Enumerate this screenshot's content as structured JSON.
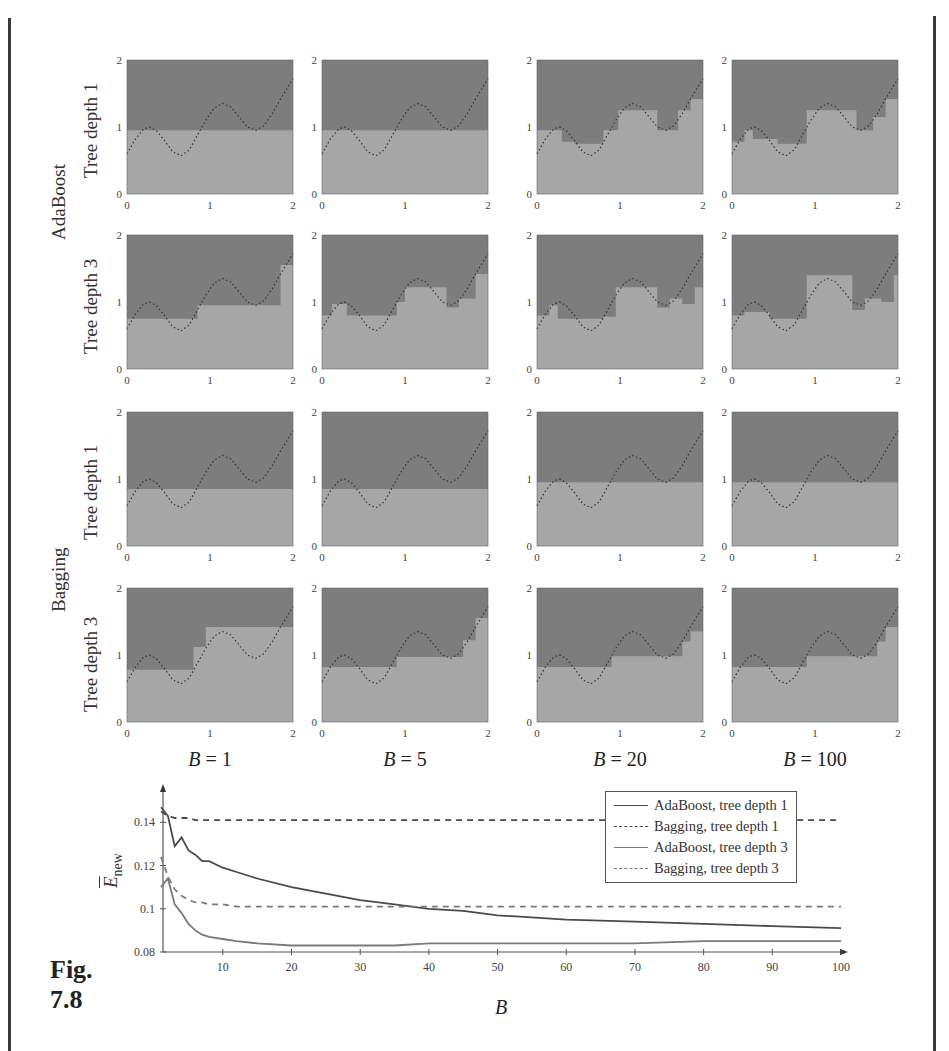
{
  "figure": {
    "label_line1": "Fig.",
    "label_line2": "7.8"
  },
  "grid": {
    "group_labels": [
      "AdaBoost",
      "Bagging"
    ],
    "row_labels": [
      "Tree depth 1",
      "Tree depth 3",
      "Tree depth 1",
      "Tree depth 3"
    ],
    "column_labels": [
      {
        "var": "B",
        "eq": " = ",
        "num": "1"
      },
      {
        "var": "B",
        "eq": " = ",
        "num": "5"
      },
      {
        "var": "B",
        "eq": " = ",
        "num": "20"
      },
      {
        "var": "B",
        "eq": " = ",
        "num": "100"
      }
    ],
    "axis_ticks": {
      "x": [
        "0",
        "1",
        "2"
      ],
      "y": [
        "0",
        "1",
        "2"
      ]
    },
    "colors": {
      "class_upper": "#7d7d7d",
      "class_lower": "#a6a6a6",
      "true_boundary": "#333333"
    }
  },
  "legend": {
    "items": [
      {
        "label": "AdaBoost, tree depth 1",
        "style": "solid-dark"
      },
      {
        "label": "Bagging, tree depth 1",
        "style": "dash-dark"
      },
      {
        "label": "AdaBoost, tree depth 3",
        "style": "solid-light"
      },
      {
        "label": "Bagging, tree depth 3",
        "style": "dash-light"
      }
    ]
  },
  "chart_data": [
    {
      "type": "heatmap",
      "title": "Decision boundaries: AdaBoost vs Bagging for B = 1, 5, 20, 100",
      "rows": [
        "AdaBoost, Tree depth 1",
        "AdaBoost, Tree depth 3",
        "Bagging, Tree depth 1",
        "Bagging, Tree depth 3"
      ],
      "columns": [
        "B = 1",
        "B = 5",
        "B = 20",
        "B = 100"
      ],
      "xlim": [
        0,
        2
      ],
      "ylim": [
        0,
        2
      ],
      "x_ticks": [
        0,
        1,
        2
      ],
      "y_ticks": [
        0,
        1,
        2
      ],
      "true_boundary": "dotted sinusoid-like curve from (0,0.6) peaking ~1.0 at x≈0.27, dipping ~0.57 at x≈0.65, peaking ~1.35 at x≈1.15, dipping ~0.95 at x≈1.55, rising to ~1.7 at x=2",
      "boundaries": {
        "AdaBoost, Tree depth 1": {
          "B = 1": "flat at y≈0.95",
          "B = 5": "flat at y≈0.95",
          "B = 20": "staircase approx. following curve",
          "B = 100": "staircase approx. following curve"
        },
        "AdaBoost, Tree depth 3": {
          "B = 1": "coarse steps",
          "B = 5": "steps",
          "B = 20": "finer steps",
          "B = 100": "finer steps"
        },
        "Bagging, Tree depth 1": {
          "B = 1": "flat at y≈0.85",
          "B = 5": "flat at y≈0.85",
          "B = 20": "flat at y≈0.95",
          "B = 100": "flat at y≈0.95"
        },
        "Bagging, Tree depth 3": {
          "B = 1": "coarse steps",
          "B = 5": "steps",
          "B = 20": "steps",
          "B = 100": "steps"
        }
      }
    },
    {
      "type": "line",
      "title": "",
      "xlabel": "B",
      "ylabel": "Ē_new",
      "xlim": [
        1,
        100
      ],
      "ylim": [
        0.08,
        0.15
      ],
      "x_ticks": [
        10,
        20,
        30,
        40,
        50,
        60,
        70,
        80,
        90,
        100
      ],
      "y_ticks": [
        0.08,
        0.1,
        0.12,
        0.14
      ],
      "legend_position": "upper right",
      "grid": false,
      "x": [
        1,
        2,
        3,
        4,
        5,
        6,
        7,
        8,
        10,
        12,
        15,
        20,
        25,
        30,
        35,
        40,
        45,
        50,
        60,
        70,
        80,
        90,
        100
      ],
      "series": [
        {
          "name": "AdaBoost, tree depth 1",
          "style": "solid",
          "color": "#4a4a4a",
          "values": [
            0.147,
            0.143,
            0.129,
            0.133,
            0.127,
            0.125,
            0.122,
            0.122,
            0.119,
            0.117,
            0.114,
            0.11,
            0.107,
            0.104,
            0.102,
            0.1,
            0.099,
            0.097,
            0.095,
            0.094,
            0.093,
            0.092,
            0.091
          ]
        },
        {
          "name": "Bagging, tree depth 1",
          "style": "dashed",
          "color": "#4a4a4a",
          "values": [
            0.145,
            0.143,
            0.142,
            0.142,
            0.142,
            0.141,
            0.141,
            0.141,
            0.141,
            0.141,
            0.141,
            0.141,
            0.141,
            0.141,
            0.141,
            0.141,
            0.141,
            0.141,
            0.141,
            0.141,
            0.141,
            0.141,
            0.141
          ]
        },
        {
          "name": "AdaBoost, tree depth 3",
          "style": "solid",
          "color": "#7a7a7a",
          "values": [
            0.11,
            0.114,
            0.102,
            0.098,
            0.093,
            0.09,
            0.088,
            0.087,
            0.086,
            0.085,
            0.084,
            0.083,
            0.083,
            0.083,
            0.083,
            0.084,
            0.084,
            0.084,
            0.084,
            0.084,
            0.085,
            0.085,
            0.085
          ]
        },
        {
          "name": "Bagging, tree depth 3",
          "style": "dashed",
          "color": "#7a7a7a",
          "values": [
            0.124,
            0.115,
            0.109,
            0.106,
            0.104,
            0.103,
            0.103,
            0.102,
            0.102,
            0.101,
            0.101,
            0.101,
            0.101,
            0.101,
            0.101,
            0.101,
            0.101,
            0.101,
            0.101,
            0.101,
            0.101,
            0.101,
            0.101
          ]
        }
      ]
    }
  ],
  "line_chart": {
    "ylabel_main": "E",
    "ylabel_sub": "new",
    "xlabel": "B",
    "y_ticks": [
      "0.08",
      "0.1",
      "0.12",
      "0.14"
    ],
    "x_ticks": [
      "10",
      "20",
      "30",
      "40",
      "50",
      "60",
      "70",
      "80",
      "90",
      "100"
    ]
  }
}
